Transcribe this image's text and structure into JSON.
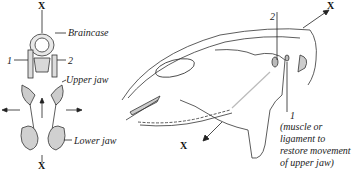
{
  "diagram": {
    "left_view": {
      "labels": {
        "braincase": "Braincase",
        "upper_jaw": "Upper jaw",
        "lower_jaw": "Lower jaw",
        "num1": "1",
        "num2": "2",
        "x_top": "X",
        "x_bottom": "X"
      }
    },
    "right_view": {
      "labels": {
        "num2": "2",
        "num1": "1",
        "x_top": "X",
        "x_bottom": "X",
        "note_line1": "(muscle or",
        "note_line2": "ligament to",
        "note_line3": "restore movement",
        "note_line4": "of upper jaw)"
      }
    }
  }
}
